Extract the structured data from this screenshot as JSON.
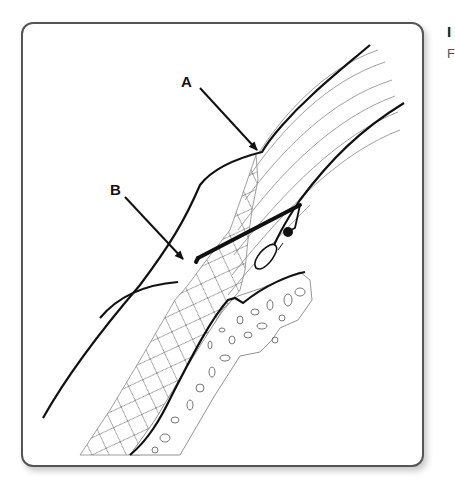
{
  "figure": {
    "labels": [
      {
        "id": "A",
        "text": "A"
      },
      {
        "id": "B",
        "text": "B"
      }
    ],
    "side_text": {
      "line1": "I",
      "line2": "F"
    },
    "colors": {
      "stroke": "#111111",
      "hatch": "#777777",
      "frame_border": "#555555",
      "background": "#ffffff"
    }
  }
}
